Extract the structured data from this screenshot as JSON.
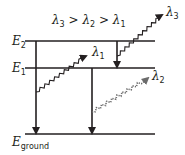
{
  "diagram": {
    "title": {
      "l3": "λ",
      "s3": "3",
      "gt1": " > ",
      "l2": "λ",
      "s2": "2",
      "gt2": " > ",
      "l1": "λ",
      "s1": "1"
    },
    "levels": [
      {
        "id": "E2",
        "symbol": "E",
        "sub": "2"
      },
      {
        "id": "E1",
        "symbol": "E",
        "sub": "1"
      },
      {
        "id": "ground",
        "symbol": "E",
        "sub": "ground"
      }
    ],
    "photons": [
      {
        "id": "lambda1",
        "symbol": "λ",
        "sub": "1",
        "style": "wavy-solid"
      },
      {
        "id": "lambda2",
        "symbol": "λ",
        "sub": "2",
        "style": "wavy-dashed"
      },
      {
        "id": "lambda3",
        "symbol": "λ",
        "sub": "3",
        "style": "wavy-solid"
      }
    ],
    "transitions": [
      {
        "from": "E2",
        "to": "ground"
      },
      {
        "from": "E2",
        "to": "E1",
        "emits": "lambda3"
      },
      {
        "from": "E1",
        "to": "ground",
        "emits": "lambda2"
      },
      {
        "from": "ground-side",
        "to": "E1",
        "emits": "lambda1"
      }
    ],
    "colors": {
      "ink": "#231f20",
      "dashed": "#6b6b6b",
      "background": "#ffffff"
    }
  }
}
